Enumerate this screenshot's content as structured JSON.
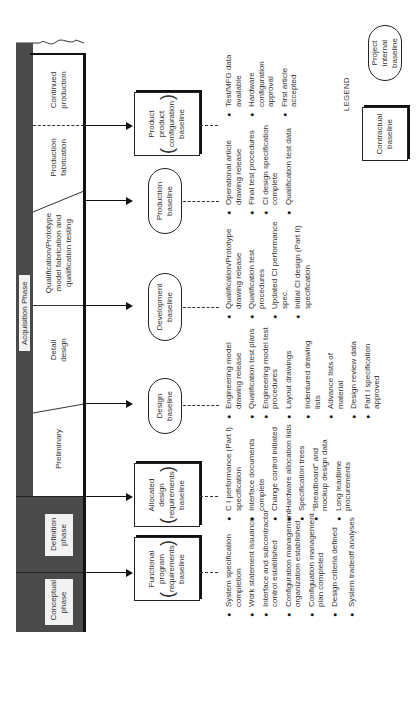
{
  "header": {
    "acquisition_label": "Acquisition Phase"
  },
  "phases": [
    {
      "id": "conceptual",
      "label": "Conceptual phase"
    },
    {
      "id": "definition",
      "label": "Definition phase"
    },
    {
      "id": "preliminary",
      "label": "Preliminary"
    },
    {
      "id": "detail",
      "label": "Detail design"
    },
    {
      "id": "qualification",
      "label": "Qualification/Prototype model fabrication and qualification testing"
    },
    {
      "id": "production",
      "label": "Production fabrication"
    },
    {
      "id": "continued",
      "label": "Continued production"
    }
  ],
  "baselines": [
    {
      "id": "functional",
      "label_top": "Functional",
      "label_mid": "program requirements",
      "label_bottom": "baseline",
      "type": "contractual"
    },
    {
      "id": "allocated",
      "label_top": "Allocated",
      "label_mid": "design requirements",
      "label_bottom": "baseline",
      "type": "contractual"
    },
    {
      "id": "design",
      "label": "Design baseline",
      "type": "internal"
    },
    {
      "id": "development",
      "label": "Development baseline",
      "type": "internal"
    },
    {
      "id": "production",
      "label": "Production baseline",
      "type": "internal"
    },
    {
      "id": "product",
      "label_top": "Product",
      "label_mid": "product configuration",
      "label_bottom": "baseline",
      "type": "contractual"
    }
  ],
  "bullets": {
    "functional": [
      "System specification completion",
      "Work statement issuance",
      "Interface and subcontractor control established",
      "Configuration management organization established",
      "Configuation management plan completed",
      "Design criteria defined",
      "System tradeoff analyses"
    ],
    "allocated": [
      "C I performance (Part I) specification",
      "Interface documents complete",
      "Change control initiated",
      "Hardware allocation lists",
      "Specification trees",
      "\"Breadboard\" and mockup design data",
      "Long leadtime procurements"
    ],
    "design": [
      "Engineering model drawing release",
      "Qualification test plans",
      "Engineering model test procedures",
      "Layout drawings",
      "Indentured drawing lists",
      "Advance lists of material",
      "Design review data",
      "Part I specification approved"
    ],
    "development": [
      "Qualification/Prototype drawing release",
      "Qualification test procedures",
      "Updated CI performance spec.",
      "Initial CI design (Part II) specification"
    ],
    "production": [
      "Operational article drawing release",
      "Final test procedures",
      "CI design specification complete",
      "Qualification test data"
    ],
    "product": [
      "Test/MFG data available",
      "Hardware configuration approval",
      "First article accepted"
    ]
  },
  "legend": {
    "title": "LEGEND",
    "contractual": "Contractual baseline",
    "internal": "Project internal baseline"
  }
}
